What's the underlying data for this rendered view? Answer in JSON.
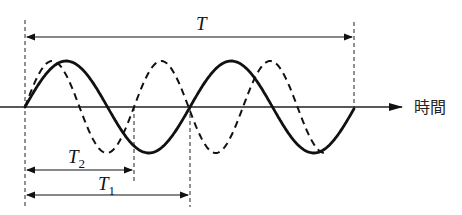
{
  "diagram": {
    "type": "waveform-comparison",
    "axis": {
      "label": "時間",
      "y": 107,
      "x_start": 0,
      "x_end": 402
    },
    "colors": {
      "ink": "#111111",
      "background": "#ffffff"
    },
    "waves": [
      {
        "name": "solid-wave",
        "style": "solid",
        "start_x": 25,
        "period_px": 165,
        "amplitude_px": 46,
        "end_x": 354,
        "cycles": 2
      },
      {
        "name": "dashed-wave",
        "style": "dashed",
        "start_x": 25,
        "period_px": 109,
        "amplitude_px": 46,
        "end_x": 325,
        "cycles": 2.75
      }
    ],
    "spans": {
      "T": {
        "label": "T",
        "subscript": "",
        "x1": 25,
        "x2": 354,
        "y": 37
      },
      "T2": {
        "label": "T",
        "subscript": "2",
        "x1": 25,
        "x2": 134,
        "y": 170
      },
      "T1": {
        "label": "T",
        "subscript": "1",
        "x1": 25,
        "x2": 190,
        "y": 195
      }
    }
  }
}
